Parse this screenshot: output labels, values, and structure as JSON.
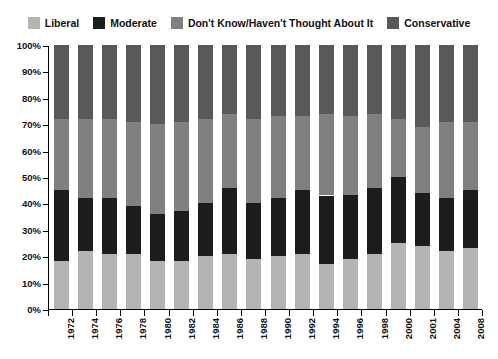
{
  "legend": {
    "position": "top",
    "items": [
      {
        "label": "Liberal",
        "color": "#b3b3b3",
        "key": "liberal"
      },
      {
        "label": "Moderate",
        "color": "#1c1c1c",
        "key": "moderate"
      },
      {
        "label": "Don't Know/Haven't Thought About It",
        "color": "#808080",
        "key": "dont_know"
      },
      {
        "label": "Conservative",
        "color": "#595959",
        "key": "conservative"
      }
    ]
  },
  "axes": {
    "y": {
      "label": "",
      "ticks": [
        "0%",
        "10%",
        "20%",
        "30%",
        "40%",
        "50%",
        "60%",
        "70%",
        "80%",
        "90%",
        "100%"
      ],
      "min": 0,
      "max": 100,
      "step": 10
    },
    "x": {
      "label": "",
      "ticks": [
        "1972",
        "1974",
        "1976",
        "1978",
        "1980",
        "1982",
        "1984",
        "1986",
        "1988",
        "1990",
        "1992",
        "1994",
        "1996",
        "1998",
        "2000",
        "2001",
        "2004",
        "2008"
      ]
    }
  },
  "chart_data": {
    "type": "bar",
    "title": "",
    "subtitle": "",
    "xlabel": "",
    "ylabel": "",
    "ylim": [
      0,
      100
    ],
    "grid": false,
    "stacked": true,
    "stack_total": 100,
    "legend_position": "top",
    "categories": [
      "1972",
      "1974",
      "1976",
      "1978",
      "1980",
      "1982",
      "1984",
      "1986",
      "1988",
      "1990",
      "1992",
      "1994",
      "1996",
      "1998",
      "2000",
      "2001",
      "2004",
      "2008"
    ],
    "series": [
      {
        "name": "Liberal",
        "color": "#b3b3b3",
        "values": [
          18,
          22,
          21,
          21,
          18,
          18,
          20,
          21,
          19,
          20,
          21,
          17,
          19,
          21,
          25,
          24,
          22,
          23
        ]
      },
      {
        "name": "Moderate",
        "color": "#1c1c1c",
        "values": [
          27,
          20,
          21,
          18,
          18,
          19,
          20,
          25,
          21,
          22,
          24,
          26,
          24,
          25,
          25,
          20,
          20,
          22
        ]
      },
      {
        "name": "Don't Know/Haven't Thought About It",
        "color": "#808080",
        "values": [
          27,
          30,
          30,
          32,
          34,
          34,
          32,
          28,
          32,
          31,
          28,
          31,
          30,
          28,
          22,
          25,
          29,
          26
        ]
      },
      {
        "name": "Conservative",
        "color": "#595959",
        "values": [
          28,
          28,
          28,
          29,
          30,
          29,
          28,
          26,
          28,
          27,
          27,
          26,
          27,
          26,
          28,
          31,
          29,
          29
        ]
      }
    ]
  }
}
